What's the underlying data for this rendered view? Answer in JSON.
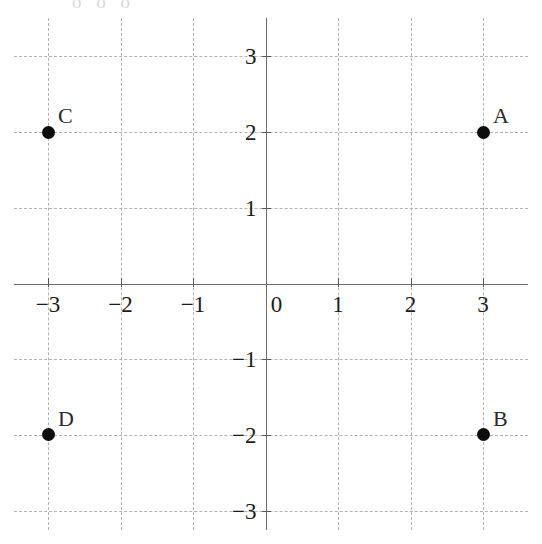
{
  "chart_data": {
    "type": "scatter",
    "title": "",
    "subtitle": "",
    "xlabel": "",
    "ylabel": "",
    "xlim": [
      -3.45,
      3.55
    ],
    "ylim": [
      -3.5,
      3.45
    ],
    "x_ticks": [
      -3,
      -2,
      -1,
      0,
      1,
      2,
      3
    ],
    "x_ticklabels": [
      "−3",
      "−2",
      "−1",
      "0",
      "1",
      "2",
      "3"
    ],
    "y_ticks": [
      3,
      2,
      1,
      -1,
      -2,
      -3
    ],
    "y_ticklabels": [
      "3",
      "2",
      "1",
      "−1",
      "−2",
      "−3"
    ],
    "grid": true,
    "grid_style": "dashed",
    "legend": false,
    "series": [
      {
        "name": "points",
        "points": [
          {
            "label": "A",
            "x": 3,
            "y": 2
          },
          {
            "label": "B",
            "x": 3,
            "y": -2
          },
          {
            "label": "C",
            "x": -3,
            "y": 2
          },
          {
            "label": "D",
            "x": -3,
            "y": -2
          }
        ]
      }
    ]
  },
  "style": {
    "background": "#ffffff",
    "grid_color": "#b3b3b3",
    "axis_color": "#6e6e6e",
    "tick_color": "#5a5a5a",
    "label_color": "#1c1c1c",
    "point_color": "#0d0d0d",
    "point_label_color": "#2a2a2a"
  },
  "artifact": {
    "top_edge_text": "o o o"
  }
}
